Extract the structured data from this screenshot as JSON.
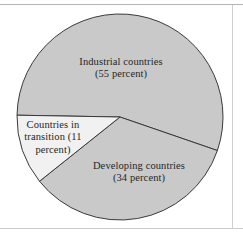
{
  "figure": {
    "background_color": "#ffffff",
    "border_color": "#b3b3b3",
    "width": 243,
    "height": 237
  },
  "chart_data": {
    "type": "pie",
    "title": "",
    "subtitle": "",
    "xlabel": "",
    "ylabel": "",
    "legend_position": "none",
    "grid": false,
    "labels_inside_slices": true,
    "categories": [
      "Industrial countries",
      "Developing countries",
      "Countries in transition"
    ],
    "values": [
      55,
      34,
      11
    ],
    "value_unit": "percent",
    "total": 100,
    "slice_label_lines": [
      [
        "Industrial countries",
        "(55 percent)"
      ],
      [
        "Developing countries",
        "(34 percent)"
      ],
      [
        "Countries in",
        "transition (11",
        "percent)"
      ]
    ],
    "slice_labels": [
      "Industrial countries (55 percent)",
      "Developing countries (34 percent)",
      "Countries in transition (11 percent)"
    ],
    "slice_colors": [
      "#c9c9c9",
      "#c9c9c9",
      "#f1f1f1"
    ],
    "slice_edge_color": "#3a3a3a",
    "start_angle_deg": 181,
    "direction": "clockwise",
    "geometry": {
      "center_x": 120,
      "center_y": 117,
      "radius": 103
    }
  },
  "labels": {
    "industrial": "Industrial countries\n(55 percent)",
    "developing": "Developing countries\n(34 percent)",
    "transition": "Countries in\ntransition (11\npercent)"
  }
}
